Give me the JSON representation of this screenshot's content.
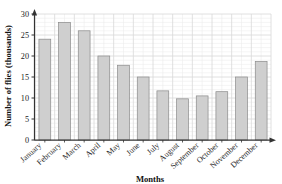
{
  "chart_data": {
    "type": "bar",
    "title": "",
    "xlabel": "Months",
    "ylabel": "Number of flies (thousands)",
    "categories": [
      "January",
      "February",
      "March",
      "April",
      "May",
      "June",
      "July",
      "August",
      "September",
      "October",
      "November",
      "December"
    ],
    "values": [
      24,
      28,
      26,
      20,
      17.8,
      15,
      11.7,
      9.8,
      10.5,
      11.5,
      15,
      18.7
    ],
    "ylim": [
      0,
      30
    ],
    "yticks": [
      0,
      5,
      10,
      15,
      20,
      25,
      30
    ],
    "ytick_labels": [
      "0",
      "5",
      "10",
      "15",
      "20",
      "25",
      "30"
    ],
    "grid": true,
    "grid_minor": true,
    "legend": "none",
    "bar_fill": "#cfcfcf",
    "bar_stroke": "#8a8a8a",
    "grid_color": "#d8d8d8",
    "grid_minor_color": "#ececec",
    "axis_color": "#333333",
    "background": "#ffffff"
  },
  "axis": {
    "y_arrow": "up-arrow-icon",
    "x_arrow": "right-arrow-icon"
  }
}
